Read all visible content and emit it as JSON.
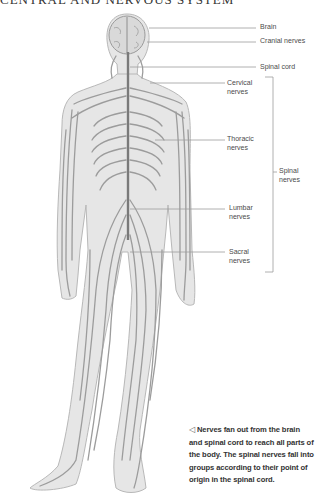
{
  "title": "CENTRAL AND NERVOUS SYSTEM",
  "labels": {
    "brain": "Brain",
    "cranial_nerves": "Cranial nerves",
    "spinal_cord": "Spinal cord",
    "cervical": [
      "Cervical",
      "nerves"
    ],
    "thoracic": [
      "Thoracic",
      "nerves"
    ],
    "lumbar": [
      "Lumbar",
      "nerves"
    ],
    "sacral": [
      "Sacral",
      "nerves"
    ],
    "spinal_nerves": [
      "Spinal",
      "nerves"
    ]
  },
  "caption": {
    "pointer_icon": "left-triangle-outline",
    "text": "Nerves fan out from the brain and spinal cord to reach all parts of the body. The spinal nerves fall into groups according to their point of origin in the spinal cord."
  },
  "colors": {
    "body_fill": "#e6e6e6",
    "body_outline": "#b5b5b5",
    "nerve": "#9a9a9a",
    "spinal_cord": "#7a7a7a",
    "leader_line": "#9d9d9d",
    "label_text": "#4a4a4a"
  }
}
